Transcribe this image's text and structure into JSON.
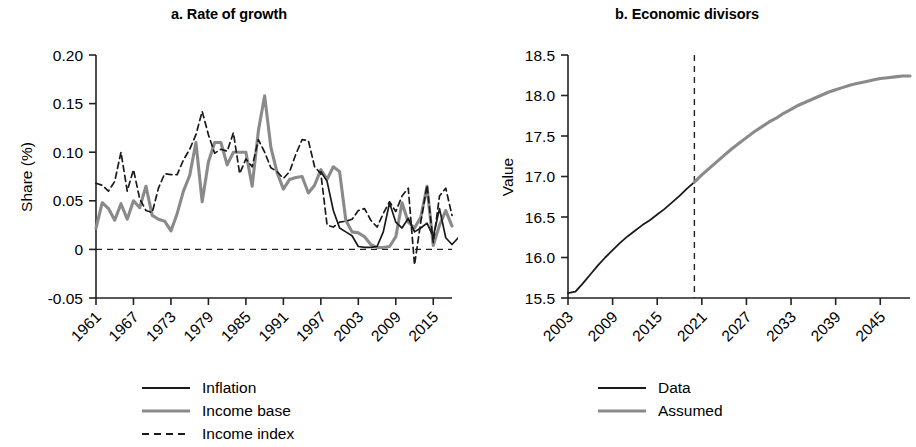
{
  "figure": {
    "background": "#ffffff",
    "colors": {
      "series_black": "#1a1a1a",
      "series_gray": "#8a8a8a",
      "axis": "#333333"
    }
  },
  "panels": {
    "a": {
      "title": "a. Rate of growth",
      "ylabel": "Share (%)",
      "ytick_labels": [
        "0.20",
        "0.15",
        "0.10",
        "0.05",
        "0",
        "-0.05"
      ],
      "xtick_labels": [
        "1961",
        "1967",
        "1973",
        "1979",
        "1985",
        "1991",
        "1997",
        "2003",
        "2009",
        "2015"
      ],
      "legend": [
        {
          "label": "Inflation",
          "style": "solid",
          "color": "#1a1a1a"
        },
        {
          "label": "Income base",
          "style": "solid",
          "color": "#8a8a8a"
        },
        {
          "label": "Income index",
          "style": "dashed",
          "color": "#1a1a1a"
        }
      ]
    },
    "b": {
      "title": "b. Economic divisors",
      "ylabel": "Value",
      "ytick_labels": [
        "18.5",
        "18.0",
        "17.5",
        "17.0",
        "16.5",
        "16.0",
        "15.5"
      ],
      "xtick_labels": [
        "2003",
        "2009",
        "2015",
        "2021",
        "2027",
        "2033",
        "2039",
        "2045"
      ],
      "legend": [
        {
          "label": "Data",
          "style": "solid",
          "color": "#1a1a1a"
        },
        {
          "label": "Assumed",
          "style": "solid",
          "color": "#8a8a8a"
        }
      ]
    }
  },
  "chart_data": [
    {
      "panel": "a",
      "type": "line",
      "title": "a. Rate of growth",
      "xlabel": "",
      "ylabel": "Share (%)",
      "xlim": [
        1961,
        2018
      ],
      "ylim": [
        -0.05,
        0.2
      ],
      "yticks": [
        0.2,
        0.15,
        0.1,
        0.05,
        0,
        -0.05
      ],
      "xticks": [
        1961,
        1967,
        1973,
        1979,
        1985,
        1991,
        1997,
        2003,
        2009,
        2015
      ],
      "grid": false,
      "zero_reference_line": 0,
      "legend_position": "bottom",
      "x": [
        1961,
        1962,
        1963,
        1964,
        1965,
        1966,
        1967,
        1968,
        1969,
        1970,
        1971,
        1972,
        1973,
        1974,
        1975,
        1976,
        1977,
        1978,
        1979,
        1980,
        1981,
        1982,
        1983,
        1984,
        1985,
        1986,
        1987,
        1988,
        1989,
        1990,
        1991,
        1992,
        1993,
        1994,
        1995,
        1996,
        1997,
        1998,
        1999,
        2000,
        2001,
        2002,
        2003,
        2004,
        2005,
        2006,
        2007,
        2008,
        2009,
        2010,
        2011,
        2012,
        2013,
        2014,
        2015,
        2016,
        2017,
        2018
      ],
      "series": [
        {
          "name": "Income base",
          "color": "#8a8a8a",
          "style": "solid",
          "values": [
            0.022,
            0.048,
            0.042,
            0.03,
            0.047,
            0.031,
            0.05,
            0.043,
            0.065,
            0.035,
            0.031,
            0.029,
            0.019,
            0.037,
            0.06,
            0.076,
            0.11,
            0.049,
            0.09,
            0.11,
            0.11,
            0.087,
            0.1,
            0.1,
            0.1,
            0.065,
            0.122,
            0.158,
            0.105,
            0.079,
            0.062,
            0.072,
            0.074,
            0.075,
            0.058,
            0.066,
            0.082,
            0.072,
            0.085,
            0.08,
            0.03,
            0.018,
            0.017,
            0.013,
            0.005,
            0.002,
            0.002,
            0.003,
            0.013,
            0.048,
            0.028,
            0.022,
            0.033,
            0.065,
            0.004,
            0.025,
            0.04,
            0.024
          ]
        },
        {
          "name": "Income index",
          "color": "#1a1a1a",
          "style": "dashed",
          "values": [
            0.068,
            0.066,
            0.06,
            0.07,
            0.1,
            0.06,
            0.082,
            0.052,
            0.04,
            0.038,
            0.063,
            0.078,
            0.077,
            0.077,
            0.092,
            0.103,
            0.118,
            0.142,
            0.118,
            0.099,
            0.103,
            0.101,
            0.12,
            0.078,
            0.093,
            0.085,
            0.113,
            0.1,
            0.084,
            0.08,
            0.073,
            0.08,
            0.098,
            0.113,
            0.112,
            0.085,
            0.078,
            0.025,
            0.023,
            0.028,
            0.029,
            0.031,
            0.04,
            0.042,
            0.03,
            0.023,
            0.037,
            0.049,
            0.039,
            0.055,
            0.063,
            -0.016,
            0.028,
            0.066,
            0.007,
            0.055,
            0.063,
            0.035
          ]
        },
        {
          "name": "Inflation",
          "color": "#1a1a1a",
          "style": "solid",
          "values": [
            null,
            null,
            null,
            null,
            null,
            null,
            null,
            null,
            null,
            null,
            null,
            null,
            null,
            null,
            null,
            null,
            null,
            null,
            null,
            null,
            null,
            null,
            null,
            null,
            null,
            null,
            null,
            null,
            null,
            null,
            null,
            null,
            null,
            null,
            null,
            null,
            0.08,
            0.07,
            0.04,
            0.022,
            0.018,
            0.014,
            0.003,
            0.002,
            0.002,
            0.003,
            0.018,
            0.048,
            0.028,
            0.022,
            0.032,
            0.018,
            0.022,
            0.027,
            0.013,
            0.042,
            0.012,
            0.005,
            0.012,
            0.005,
            0.03,
            -0.028,
            0.012,
            0.002,
            0.018,
            0.008
          ]
        }
      ]
    },
    {
      "panel": "b",
      "type": "line",
      "title": "b. Economic divisors",
      "xlabel": "",
      "ylabel": "Value",
      "xlim": [
        2003,
        2049
      ],
      "ylim": [
        15.5,
        18.5
      ],
      "yticks": [
        18.5,
        18.0,
        17.5,
        17.0,
        16.5,
        16.0,
        15.5
      ],
      "xticks": [
        2003,
        2009,
        2015,
        2021,
        2027,
        2033,
        2039,
        2045
      ],
      "grid": false,
      "vertical_divider_year": 2020,
      "legend_position": "bottom",
      "series": [
        {
          "name": "Data",
          "color": "#1a1a1a",
          "style": "solid",
          "x": [
            2003,
            2004,
            2005,
            2006,
            2007,
            2008,
            2009,
            2010,
            2011,
            2012,
            2013,
            2014,
            2015,
            2016,
            2017,
            2018,
            2019,
            2020
          ],
          "values": [
            15.56,
            15.58,
            15.68,
            15.79,
            15.9,
            16.0,
            16.09,
            16.18,
            16.26,
            16.33,
            16.4,
            16.46,
            16.53,
            16.6,
            16.68,
            16.76,
            16.85,
            16.93
          ]
        },
        {
          "name": "Assumed",
          "color": "#8a8a8a",
          "style": "solid",
          "x": [
            2020,
            2021,
            2022,
            2023,
            2024,
            2025,
            2026,
            2027,
            2028,
            2029,
            2030,
            2031,
            2032,
            2033,
            2034,
            2035,
            2036,
            2037,
            2038,
            2039,
            2040,
            2041,
            2042,
            2043,
            2044,
            2045,
            2046,
            2047,
            2048,
            2049
          ],
          "values": [
            16.93,
            17.02,
            17.1,
            17.18,
            17.26,
            17.34,
            17.41,
            17.48,
            17.55,
            17.61,
            17.67,
            17.72,
            17.78,
            17.83,
            17.88,
            17.92,
            17.96,
            18.0,
            18.04,
            18.07,
            18.1,
            18.13,
            18.15,
            18.17,
            18.19,
            18.21,
            18.22,
            18.23,
            18.24,
            18.24
          ]
        }
      ]
    }
  ]
}
